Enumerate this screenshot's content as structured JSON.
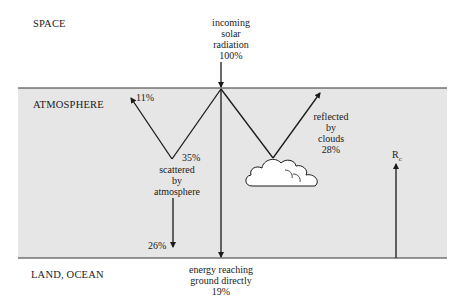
{
  "regions": {
    "space": "SPACE",
    "atmosphere": "ATMOSPHERE",
    "land_ocean": "LAND, OCEAN"
  },
  "incoming": {
    "line1": "incoming",
    "line2": "solar",
    "line3": "radiation",
    "value": "100%"
  },
  "scattered_up": {
    "value": "11%"
  },
  "scattered": {
    "value": "35%",
    "line1": "scattered",
    "line2": "by",
    "line3": "atmosphere"
  },
  "scattered_down": {
    "value": "26%"
  },
  "reflected": {
    "line1": "reflected",
    "line2": "by",
    "line3": "clouds",
    "value": "28%"
  },
  "direct": {
    "line1": "energy reaching",
    "line2": "ground directly",
    "value": "19%"
  },
  "reradiated": {
    "label": "R",
    "subscript": "c"
  },
  "colors": {
    "atmosphere_fill": "#e6e6e6",
    "line": "#1a1a1a",
    "background": "#ffffff"
  }
}
